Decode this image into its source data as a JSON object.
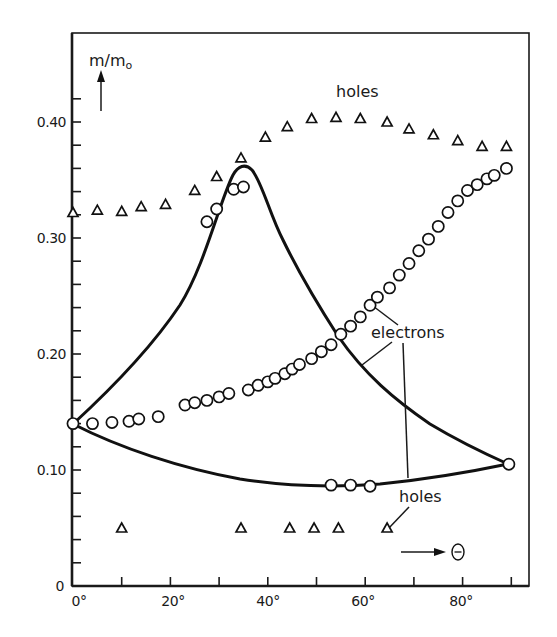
{
  "chart_data": {
    "type": "scatter",
    "title": "",
    "xlabel": "Θ",
    "ylabel": "m/m₀",
    "xlim": [
      0,
      95
    ],
    "ylim": [
      0,
      0.47
    ],
    "x_ticks": [
      0,
      10,
      20,
      30,
      40,
      50,
      60,
      70,
      80,
      90
    ],
    "x_tick_labels": [
      "0°",
      "20°",
      "40°",
      "60°",
      "80°"
    ],
    "y_ticks": [
      0,
      0.02,
      0.04,
      0.06,
      0.08,
      0.1,
      0.12,
      0.14,
      0.16,
      0.18,
      0.2,
      0.22,
      0.24,
      0.26,
      0.28,
      0.3,
      0.32,
      0.34,
      0.36,
      0.38,
      0.4,
      0.42
    ],
    "y_tick_labels": [
      "0",
      "0.10",
      "0.20",
      "0.30",
      "0.40"
    ],
    "grid": false,
    "legend": "none",
    "annotations": [
      "holes",
      "electrons",
      "holes"
    ],
    "series": [
      {
        "name": "holes (upper, measured)",
        "marker": "triangle",
        "x": [
          0,
          5,
          10,
          14,
          19,
          25,
          29.5,
          34.5,
          39.5,
          44,
          49,
          54,
          59,
          64.5,
          69,
          74,
          79,
          84,
          89
        ],
        "y": [
          0.322,
          0.324,
          0.323,
          0.327,
          0.329,
          0.341,
          0.353,
          0.369,
          0.387,
          0.396,
          0.403,
          0.404,
          0.403,
          0.4,
          0.394,
          0.389,
          0.384,
          0.379,
          0.379
        ]
      },
      {
        "name": "holes (lower, measured)",
        "marker": "triangle",
        "x": [
          10,
          34.5,
          44.5,
          49.5,
          54.5,
          64.5
        ],
        "y": [
          0.05,
          0.05,
          0.05,
          0.05,
          0.05,
          0.05
        ]
      },
      {
        "name": "electrons (measured)",
        "marker": "circle",
        "x": [
          0,
          4,
          8,
          11.5,
          13.5,
          17.5,
          23,
          25,
          27.5,
          27.5,
          29.5,
          30,
          32,
          33,
          35,
          36,
          38,
          40,
          41.5,
          43.5,
          45,
          46.5,
          49,
          51,
          53,
          55,
          57,
          59,
          61,
          62.5,
          65,
          67,
          69,
          71,
          73,
          75,
          77,
          79,
          81,
          83,
          85,
          86.5,
          89
        ],
        "y": [
          0.14,
          0.14,
          0.141,
          0.142,
          0.144,
          0.146,
          0.156,
          0.158,
          0.16,
          0.314,
          0.325,
          0.163,
          0.166,
          0.342,
          0.344,
          0.169,
          0.173,
          0.176,
          0.179,
          0.183,
          0.187,
          0.191,
          0.196,
          0.202,
          0.208,
          0.217,
          0.224,
          0.232,
          0.242,
          0.249,
          0.257,
          0.268,
          0.278,
          0.289,
          0.299,
          0.31,
          0.322,
          0.332,
          0.341,
          0.346,
          0.351,
          0.354,
          0.36
        ]
      },
      {
        "name": "holes (lower, measured circles)",
        "marker": "circle",
        "x": [
          53,
          57,
          61,
          89.5
        ],
        "y": [
          0.087,
          0.087,
          0.086,
          0.105
        ]
      },
      {
        "name": "electrons (theory curve)",
        "marker": "none",
        "x": [
          0,
          10,
          20,
          28,
          32,
          34.3,
          38,
          43,
          48,
          53,
          60,
          68,
          78,
          89.5
        ],
        "y": [
          0.14,
          0.19,
          0.255,
          0.32,
          0.35,
          0.362,
          0.345,
          0.3,
          0.255,
          0.22,
          0.188,
          0.155,
          0.126,
          0.105
        ]
      },
      {
        "name": "holes (theory curve)",
        "marker": "none",
        "x": [
          0,
          10,
          20,
          30,
          40,
          50,
          60,
          70,
          80,
          89.5
        ],
        "y": [
          0.14,
          0.13,
          0.12,
          0.107,
          0.094,
          0.088,
          0.087,
          0.089,
          0.096,
          0.105
        ]
      }
    ]
  },
  "labels": {
    "y_axis": "m/m",
    "y_axis_sub": "o",
    "x_axis": "Θ",
    "holes_top": "holes",
    "electrons": "electrons",
    "holes_bottom": "holes",
    "y0": "0",
    "y10": "0.10",
    "y20": "0.20",
    "y30": "0.30",
    "y40": "0.40",
    "x0": "0°",
    "x20": "20°",
    "x40": "40°",
    "x60": "60°",
    "x80": "80°"
  }
}
